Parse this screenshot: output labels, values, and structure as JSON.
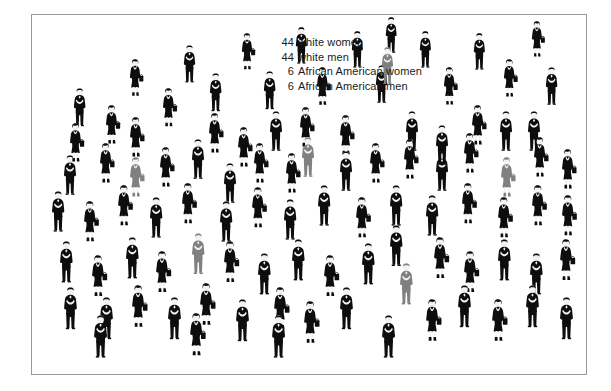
{
  "legend": {
    "lines": [
      {
        "count": "44",
        "label": "white women"
      },
      {
        "count": "44",
        "label": "white men"
      },
      {
        "count": "6",
        "label": "African American women"
      },
      {
        "count": "6",
        "label": "African American men"
      }
    ]
  },
  "colors": {
    "background": "#ffffff",
    "frame_border": "#9a9a9a",
    "white_person": "#0d0d0d",
    "african_american_person": "#808080",
    "skin": "#f2f2f2",
    "text": "#1a1a1a"
  },
  "chart_data": {
    "type": "pictogram",
    "title": "",
    "unit": "1 icon = 1 person",
    "total": 100,
    "categories": [
      "white women",
      "white men",
      "African American women",
      "African American men"
    ],
    "values": [
      44,
      44,
      6,
      6
    ],
    "series": [
      {
        "name": "white women",
        "value": 44,
        "color": "#0d0d0d",
        "glyph": "woman"
      },
      {
        "name": "white men",
        "value": 44,
        "color": "#0d0d0d",
        "glyph": "man"
      },
      {
        "name": "African American women",
        "value": 6,
        "color": "#808080",
        "glyph": "woman"
      },
      {
        "name": "African American men",
        "value": 6,
        "color": "#808080",
        "glyph": "man"
      }
    ],
    "legend_position": "top-center",
    "grid": false
  },
  "figures": [
    {
      "x": 40,
      "y": 73,
      "s": 0.96,
      "g": "man",
      "c": "w"
    },
    {
      "x": 72,
      "y": 90,
      "s": 0.98,
      "g": "woman",
      "c": "w"
    },
    {
      "x": 96,
      "y": 102,
      "s": 1.0,
      "g": "woman",
      "c": "w"
    },
    {
      "x": 96,
      "y": 44,
      "s": 0.93,
      "g": "woman",
      "c": "w"
    },
    {
      "x": 129,
      "y": 73,
      "s": 0.97,
      "g": "woman",
      "c": "w"
    },
    {
      "x": 150,
      "y": 30,
      "s": 0.94,
      "g": "man",
      "c": "w"
    },
    {
      "x": 176,
      "y": 58,
      "s": 0.96,
      "g": "man",
      "c": "w"
    },
    {
      "x": 175,
      "y": 98,
      "s": 1.0,
      "g": "woman",
      "c": "w"
    },
    {
      "x": 208,
      "y": 18,
      "s": 0.92,
      "g": "woman",
      "c": "w"
    },
    {
      "x": 230,
      "y": 56,
      "s": 0.96,
      "g": "man",
      "c": "w"
    },
    {
      "x": 236,
      "y": 96,
      "s": 1.0,
      "g": "man",
      "c": "w"
    },
    {
      "x": 262,
      "y": 12,
      "s": 0.92,
      "g": "man",
      "c": "w"
    },
    {
      "x": 283,
      "y": 52,
      "s": 0.96,
      "g": "woman",
      "c": "w"
    },
    {
      "x": 266,
      "y": 92,
      "s": 1.0,
      "g": "woman",
      "c": "w"
    },
    {
      "x": 318,
      "y": 16,
      "s": 0.92,
      "g": "man",
      "c": "w"
    },
    {
      "x": 342,
      "y": 50,
      "s": 0.95,
      "g": "man",
      "c": "w"
    },
    {
      "x": 306,
      "y": 100,
      "s": 1.0,
      "g": "woman",
      "c": "w"
    },
    {
      "x": 386,
      "y": 16,
      "s": 0.92,
      "g": "man",
      "c": "w"
    },
    {
      "x": 352,
      "y": 2,
      "s": 0.9,
      "g": "man",
      "c": "w"
    },
    {
      "x": 410,
      "y": 52,
      "s": 0.95,
      "g": "woman",
      "c": "w"
    },
    {
      "x": 372,
      "y": 96,
      "s": 1.0,
      "g": "man",
      "c": "w"
    },
    {
      "x": 440,
      "y": 18,
      "s": 0.92,
      "g": "man",
      "c": "w"
    },
    {
      "x": 470,
      "y": 44,
      "s": 0.95,
      "g": "woman",
      "c": "w"
    },
    {
      "x": 438,
      "y": 90,
      "s": 1.0,
      "g": "woman",
      "c": "w"
    },
    {
      "x": 498,
      "y": 6,
      "s": 0.9,
      "g": "woman",
      "c": "w"
    },
    {
      "x": 512,
      "y": 52,
      "s": 0.95,
      "g": "man",
      "c": "w"
    },
    {
      "x": 494,
      "y": 96,
      "s": 1.0,
      "g": "man",
      "c": "w"
    },
    {
      "x": 348,
      "y": 32,
      "s": 0.93,
      "g": "man",
      "c": "aa"
    },
    {
      "x": 96,
      "y": 142,
      "s": 1.0,
      "g": "woman",
      "c": "aa"
    },
    {
      "x": 268,
      "y": 122,
      "s": 1.0,
      "g": "man",
      "c": "aa"
    },
    {
      "x": 467,
      "y": 142,
      "s": 1.0,
      "g": "woman",
      "c": "aa"
    },
    {
      "x": 158,
      "y": 218,
      "s": 1.03,
      "g": "man",
      "c": "aa"
    },
    {
      "x": 366,
      "y": 248,
      "s": 1.04,
      "g": "man",
      "c": "aa"
    },
    {
      "x": 30,
      "y": 140,
      "s": 1.0,
      "g": "man",
      "c": "w"
    },
    {
      "x": 66,
      "y": 128,
      "s": 1.0,
      "g": "woman",
      "c": "w"
    },
    {
      "x": 126,
      "y": 132,
      "s": 1.0,
      "g": "woman",
      "c": "w"
    },
    {
      "x": 158,
      "y": 124,
      "s": 1.0,
      "g": "man",
      "c": "w"
    },
    {
      "x": 190,
      "y": 148,
      "s": 1.0,
      "g": "man",
      "c": "w"
    },
    {
      "x": 220,
      "y": 128,
      "s": 1.0,
      "g": "woman",
      "c": "w"
    },
    {
      "x": 252,
      "y": 138,
      "s": 1.0,
      "g": "woman",
      "c": "w"
    },
    {
      "x": 306,
      "y": 136,
      "s": 1.0,
      "g": "man",
      "c": "w"
    },
    {
      "x": 336,
      "y": 128,
      "s": 1.0,
      "g": "woman",
      "c": "w"
    },
    {
      "x": 370,
      "y": 124,
      "s": 1.0,
      "g": "woman",
      "c": "w"
    },
    {
      "x": 402,
      "y": 136,
      "s": 1.0,
      "g": "man",
      "c": "w"
    },
    {
      "x": 430,
      "y": 118,
      "s": 1.0,
      "g": "woman",
      "c": "w"
    },
    {
      "x": 500,
      "y": 122,
      "s": 1.0,
      "g": "woman",
      "c": "w"
    },
    {
      "x": 528,
      "y": 134,
      "s": 1.0,
      "g": "woman",
      "c": "w"
    },
    {
      "x": 18,
      "y": 176,
      "s": 1.02,
      "g": "man",
      "c": "w"
    },
    {
      "x": 50,
      "y": 186,
      "s": 1.02,
      "g": "woman",
      "c": "w"
    },
    {
      "x": 84,
      "y": 170,
      "s": 1.02,
      "g": "woman",
      "c": "w"
    },
    {
      "x": 116,
      "y": 182,
      "s": 1.02,
      "g": "man",
      "c": "w"
    },
    {
      "x": 148,
      "y": 168,
      "s": 1.02,
      "g": "woman",
      "c": "w"
    },
    {
      "x": 186,
      "y": 186,
      "s": 1.02,
      "g": "man",
      "c": "w"
    },
    {
      "x": 218,
      "y": 172,
      "s": 1.02,
      "g": "woman",
      "c": "w"
    },
    {
      "x": 250,
      "y": 184,
      "s": 1.02,
      "g": "man",
      "c": "w"
    },
    {
      "x": 284,
      "y": 170,
      "s": 1.02,
      "g": "man",
      "c": "w"
    },
    {
      "x": 322,
      "y": 182,
      "s": 1.02,
      "g": "woman",
      "c": "w"
    },
    {
      "x": 356,
      "y": 170,
      "s": 1.02,
      "g": "man",
      "c": "w"
    },
    {
      "x": 392,
      "y": 180,
      "s": 1.02,
      "g": "man",
      "c": "w"
    },
    {
      "x": 428,
      "y": 168,
      "s": 1.02,
      "g": "woman",
      "c": "w"
    },
    {
      "x": 464,
      "y": 182,
      "s": 1.02,
      "g": "woman",
      "c": "w"
    },
    {
      "x": 498,
      "y": 170,
      "s": 1.02,
      "g": "woman",
      "c": "w"
    },
    {
      "x": 528,
      "y": 180,
      "s": 1.02,
      "g": "woman",
      "c": "w"
    },
    {
      "x": 26,
      "y": 226,
      "s": 1.04,
      "g": "man",
      "c": "w"
    },
    {
      "x": 58,
      "y": 240,
      "s": 1.04,
      "g": "woman",
      "c": "w"
    },
    {
      "x": 92,
      "y": 222,
      "s": 1.04,
      "g": "man",
      "c": "w"
    },
    {
      "x": 122,
      "y": 236,
      "s": 1.04,
      "g": "woman",
      "c": "w"
    },
    {
      "x": 190,
      "y": 226,
      "s": 1.04,
      "g": "woman",
      "c": "w"
    },
    {
      "x": 224,
      "y": 238,
      "s": 1.04,
      "g": "man",
      "c": "w"
    },
    {
      "x": 258,
      "y": 224,
      "s": 1.04,
      "g": "man",
      "c": "w"
    },
    {
      "x": 290,
      "y": 240,
      "s": 1.04,
      "g": "woman",
      "c": "w"
    },
    {
      "x": 328,
      "y": 228,
      "s": 1.04,
      "g": "man",
      "c": "w"
    },
    {
      "x": 400,
      "y": 222,
      "s": 1.04,
      "g": "woman",
      "c": "w"
    },
    {
      "x": 430,
      "y": 236,
      "s": 1.04,
      "g": "woman",
      "c": "w"
    },
    {
      "x": 464,
      "y": 224,
      "s": 1.04,
      "g": "man",
      "c": "w"
    },
    {
      "x": 496,
      "y": 238,
      "s": 1.04,
      "g": "man",
      "c": "w"
    },
    {
      "x": 526,
      "y": 224,
      "s": 1.04,
      "g": "woman",
      "c": "w"
    },
    {
      "x": 30,
      "y": 272,
      "s": 1.06,
      "g": "man",
      "c": "w"
    },
    {
      "x": 66,
      "y": 282,
      "s": 1.06,
      "g": "man",
      "c": "w"
    },
    {
      "x": 98,
      "y": 270,
      "s": 1.06,
      "g": "woman",
      "c": "w"
    },
    {
      "x": 134,
      "y": 282,
      "s": 1.06,
      "g": "man",
      "c": "w"
    },
    {
      "x": 166,
      "y": 268,
      "s": 1.06,
      "g": "woman",
      "c": "w"
    },
    {
      "x": 202,
      "y": 284,
      "s": 1.06,
      "g": "man",
      "c": "w"
    },
    {
      "x": 240,
      "y": 272,
      "s": 1.06,
      "g": "woman",
      "c": "w"
    },
    {
      "x": 270,
      "y": 286,
      "s": 1.06,
      "g": "woman",
      "c": "w"
    },
    {
      "x": 306,
      "y": 272,
      "s": 1.06,
      "g": "man",
      "c": "w"
    },
    {
      "x": 392,
      "y": 284,
      "s": 1.06,
      "g": "woman",
      "c": "w"
    },
    {
      "x": 424,
      "y": 270,
      "s": 1.06,
      "g": "man",
      "c": "w"
    },
    {
      "x": 458,
      "y": 284,
      "s": 1.06,
      "g": "woman",
      "c": "w"
    },
    {
      "x": 492,
      "y": 270,
      "s": 1.06,
      "g": "man",
      "c": "w"
    },
    {
      "x": 526,
      "y": 282,
      "s": 1.06,
      "g": "man",
      "c": "w"
    },
    {
      "x": 402,
      "y": 110,
      "s": 1.0,
      "g": "man",
      "c": "w"
    },
    {
      "x": 466,
      "y": 96,
      "s": 1.0,
      "g": "man",
      "c": "w"
    },
    {
      "x": 36,
      "y": 108,
      "s": 0.98,
      "g": "woman",
      "c": "w"
    },
    {
      "x": 204,
      "y": 112,
      "s": 1.0,
      "g": "woman",
      "c": "w"
    },
    {
      "x": 356,
      "y": 210,
      "s": 1.03,
      "g": "man",
      "c": "w"
    },
    {
      "x": 156,
      "y": 298,
      "s": 1.07,
      "g": "woman",
      "c": "w"
    },
    {
      "x": 348,
      "y": 300,
      "s": 1.07,
      "g": "man",
      "c": "w"
    },
    {
      "x": 238,
      "y": 300,
      "s": 1.07,
      "g": "man",
      "c": "w"
    },
    {
      "x": 60,
      "y": 300,
      "s": 1.07,
      "g": "man",
      "c": "w"
    }
  ]
}
